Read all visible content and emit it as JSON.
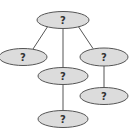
{
  "diagram": {
    "type": "tree",
    "nodes": [
      {
        "id": "root",
        "label": "?",
        "cx": 63,
        "cy": 20,
        "rx": 26,
        "ry": 8.5
      },
      {
        "id": "left",
        "label": "?",
        "cx": 23,
        "cy": 57,
        "rx": 24,
        "ry": 8.5
      },
      {
        "id": "middle",
        "label": "?",
        "cx": 63,
        "cy": 76,
        "rx": 25,
        "ry": 8.5
      },
      {
        "id": "right",
        "label": "?",
        "cx": 104,
        "cy": 57,
        "rx": 24,
        "ry": 9
      },
      {
        "id": "middle-child",
        "label": "?",
        "cx": 63,
        "cy": 119,
        "rx": 25,
        "ry": 8.5
      },
      {
        "id": "right-child",
        "label": "?",
        "cx": 104,
        "cy": 96,
        "rx": 24,
        "ry": 8.5
      }
    ],
    "edges": [
      {
        "from": "root",
        "to": "left"
      },
      {
        "from": "root",
        "to": "middle"
      },
      {
        "from": "root",
        "to": "right"
      },
      {
        "from": "middle",
        "to": "middle-child"
      },
      {
        "from": "right",
        "to": "right-child"
      }
    ]
  },
  "colors": {
    "node_fill": "#dcdcdc",
    "stroke": "#555555",
    "text": "#333333",
    "background": "#ffffff"
  }
}
